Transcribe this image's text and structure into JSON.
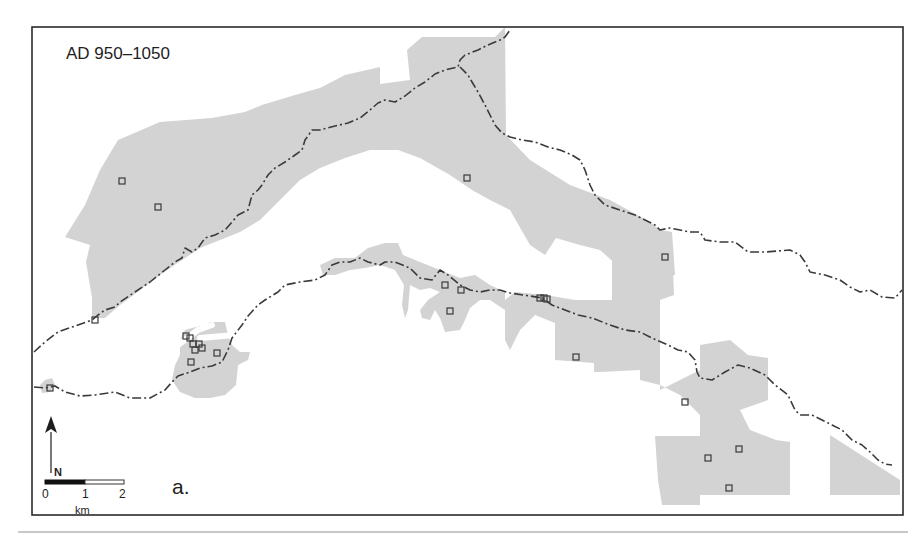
{
  "map": {
    "title": "AD 950–1050",
    "panel_label": "a.",
    "colors": {
      "land": "#d3d3d3",
      "boundary": "#3a3a3a",
      "frame": "#2a2a2a",
      "site": "#3a3a3a",
      "background": "#ffffff"
    },
    "north_arrow": {
      "icon": "north-arrow-icon",
      "label": "N"
    },
    "scale_bar": {
      "ticks": [
        "0",
        "1",
        "2"
      ],
      "unit": "km"
    },
    "land_polygons": [
      "M92,318 L92,298 L86,262 L90,245 L65,237 L85,205 L100,170 L118,140 L160,122 L212,118 L245,112 L262,105 L295,95 L320,88 L345,75 L380,67 L380,84 L395,82 L410,80 L407,50 L422,37 L495,37 L505,27 L506,135 L530,160 L570,185 L610,200 L650,222 L660,230 L672,232 L674,260 L675,275 L650,278 L645,262 L632,270 L620,268 L600,250 L580,245 L556,238 L545,255 L530,245 L510,210 L490,200 L472,190 L450,175 L420,158 L398,150 L370,150 L345,158 L320,168 L300,180 L280,200 L260,220 L240,232 L220,240 L200,248 L182,260 L160,275 L140,290 L120,305 L105,318 Z",
      "M612,245 L672,245 L674,295 L660,300 L660,390 L700,370 L700,345 L730,340 L748,355 L768,358 L768,400 L740,410 L750,430 L776,440 L790,442 L790,495 L700,495 L700,505 L662,505 L658,480 L655,436 L700,436 L700,415 L680,395 L660,385 L640,380 L640,370 L600,372 L594,372 L594,363 L555,360 L555,323 L535,315 L520,330 L510,350 L505,340 L505,300 L515,292 L545,295 L575,300 L612,300 Z",
      "M320,265 L335,258 L355,258 L368,248 L385,243 L398,243 L403,255 L420,262 L440,270 L460,278 L475,275 L490,285 L505,292 L505,310 L490,300 L480,300 L470,308 L465,320 L460,330 L445,332 L440,318 L435,310 L430,320 L422,318 L420,310 L428,300 L440,292 L430,288 L420,290 L410,285 L408,310 L405,318 L402,305 L404,285 L395,270 L380,265 L365,268 L350,270 L335,275 L323,275 Z",
      "M830,435 L900,480 L900,495 L830,495 Z",
      "M180,340 L185,330 L192,328 L205,325 L210,322 L225,322 L228,335 L232,345 L240,352 L250,352 L248,360 L238,365 L236,385 L225,395 L210,398 L195,398 L180,392 L172,380 L175,365 L180,355 Z",
      "M40,385 L45,380 L52,378 L55,385 L50,392 L42,393 Z"
    ],
    "rivers": [
      "M92,352 L115,345 L130,330 L145,318 L160,305 L165,300",
      "M92,352 L120,352 L150,348 L175,345",
      "M120,312 L122,330 L128,340",
      "M178,345 L198,330 L212,325",
      "M200,338 L235,335 L250,330"
    ],
    "boundaries": [
      "M34,352 L45,342 L58,332 L75,326 L92,320 L98,315 L105,310 L115,307 L120,302 L135,292 L150,282 L165,270 L175,262 L182,258 L185,248 L192,252 L198,248 L205,238 L215,235 L225,230 L232,222 L238,215 L248,210 L252,195 L258,190 L262,185 L268,175 L275,168 L285,162 L295,155 L302,150 L305,140 L308,136 L312,130 L320,130 L335,126 L348,123 L360,118 L370,110 L378,103 L385,100 L395,102 L405,96 L415,88 L425,82 L435,74 L445,70 L458,67 L460,60 L465,55 L478,50 L488,45 L500,40 L505,37 L510,30",
      "M460,67 L468,75 L472,82 L478,92 L485,105 L490,115 L495,125 L502,133 L510,137 L522,140 L535,142 L548,147 L560,150 L572,155 L580,160 L585,170 L590,185 L595,195 L605,205 L620,210 L635,215 L645,220 L655,225 L660,230 L670,228 L680,230 L690,232 L700,232 L705,240 L720,242 L735,242 L748,252 L765,252 L790,250 L800,255 L805,262 L810,272 L825,275 L840,280 L850,287 L860,292 L870,290 L882,297 L895,298 L902,290",
      "M34,387 L45,388 L55,386 L65,392 L80,396 L95,395 L115,392 L130,398 L150,398 L165,390 L172,382 L178,376 L190,372 L200,368 L212,366 L222,362 L228,350 L232,338 L242,325 L248,316 L258,305 L265,300 L278,292 L285,285 L300,282 L315,280 L325,275 L332,265 L340,262 L350,262 L360,258 L368,262 L380,265 L385,262 L395,262 L410,268 L420,278 L432,280 L440,270 L448,275 L460,285 L470,290 L480,292 L490,290 L500,290 L510,293 L530,296 L542,298 L552,305 L565,310 L578,315 L592,318 L610,325 L625,330 L640,332 L652,338 L668,345 L678,350 L688,352 L695,360 L697,372 L700,378 L712,380 L725,372 L738,365 L750,368 L765,375 L775,385 L788,395 L795,410 L800,415 L812,415 L822,420 L832,425 L842,430 L852,440 L862,445 L870,452 L878,460 L885,464 L892,465"
    ],
    "sites": [
      [
        122,
        181
      ],
      [
        158,
        207
      ],
      [
        467,
        178
      ],
      [
        665,
        257
      ],
      [
        95,
        320
      ],
      [
        50,
        388
      ],
      [
        186,
        336
      ],
      [
        190,
        338
      ],
      [
        193,
        344
      ],
      [
        199,
        344
      ],
      [
        202,
        348
      ],
      [
        195,
        350
      ],
      [
        191,
        362
      ],
      [
        217,
        353
      ],
      [
        445,
        285
      ],
      [
        461,
        290
      ],
      [
        450,
        311
      ],
      [
        540,
        298
      ],
      [
        544,
        298
      ],
      [
        547,
        299
      ],
      [
        576,
        357
      ],
      [
        685,
        402
      ],
      [
        739,
        449
      ],
      [
        708,
        458
      ],
      [
        729,
        488
      ]
    ]
  }
}
